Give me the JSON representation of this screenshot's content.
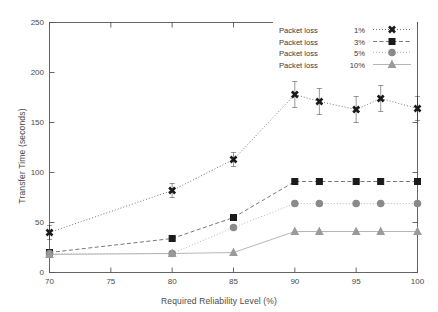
{
  "chart_data": {
    "type": "line",
    "title": "",
    "xlabel": "Required Reliability Level (%)",
    "ylabel": "Transfer Time (seconds)",
    "xlim": [
      70,
      100
    ],
    "ylim": [
      0,
      250
    ],
    "xticks": [
      70,
      75,
      80,
      85,
      90,
      95,
      100
    ],
    "yticks": [
      0,
      50,
      100,
      150,
      200,
      250
    ],
    "grid": false,
    "legend_position": "top-right",
    "x": [
      70,
      80,
      85,
      90,
      92,
      95,
      97,
      100
    ],
    "series": [
      {
        "name": "Packet loss   1%",
        "label_prefix": "Packet loss",
        "label_value": "1%",
        "marker": "cross",
        "linestyle": "dotted",
        "color": "#1a1a1a",
        "values": [
          40,
          82,
          113,
          178,
          171,
          163,
          174,
          164
        ],
        "errors": [
          7,
          7,
          7,
          13,
          13,
          13,
          13,
          12
        ]
      },
      {
        "name": "Packet loss   3%",
        "label_prefix": "Packet loss",
        "label_value": "3%",
        "marker": "square",
        "linestyle": "dashed",
        "color": "#1a1a1a",
        "values": [
          20,
          34,
          55,
          91,
          91,
          91,
          91,
          91
        ],
        "errors": [
          0,
          0,
          0,
          0,
          0,
          3,
          0,
          0
        ]
      },
      {
        "name": "Packet loss   5%",
        "label_prefix": "Packet loss",
        "label_value": "5%",
        "marker": "circle",
        "linestyle": "dotted",
        "color": "#8a8a8a",
        "values": [
          19,
          19,
          45,
          69,
          69,
          69,
          69,
          69
        ],
        "errors": [
          0,
          0,
          0,
          0,
          0,
          0,
          0,
          0
        ]
      },
      {
        "name": "Packet loss  10%",
        "label_prefix": "Packet loss",
        "label_value": "10%",
        "marker": "triangle",
        "linestyle": "solid",
        "color": "#9a9a9a",
        "values": [
          18,
          19,
          20,
          41,
          41,
          41,
          41,
          41
        ],
        "errors": [
          0,
          0,
          0,
          0,
          0,
          0,
          0,
          0
        ]
      }
    ]
  },
  "legend": {
    "entries": [
      {
        "name": "Packet loss",
        "value": "1%"
      },
      {
        "name": "Packet loss",
        "value": "3%"
      },
      {
        "name": "Packet loss",
        "value": "5%"
      },
      {
        "name": "Packet loss",
        "value": "10%"
      }
    ]
  },
  "axes": {
    "x_title": "Required Reliability Level (%)",
    "y_title": "Transfer Time (seconds)",
    "x_tick_labels": [
      "70",
      "75",
      "80",
      "85",
      "90",
      "95",
      "100"
    ],
    "y_tick_labels": [
      "0",
      "50",
      "100",
      "150",
      "200",
      "250"
    ]
  },
  "colors": {
    "frame": "#555555",
    "text": "#4a4a4a",
    "series_dark": "#1a1a1a",
    "series_mid": "#8a8a8a",
    "series_light": "#9a9a9a",
    "background": "#ffffff"
  }
}
